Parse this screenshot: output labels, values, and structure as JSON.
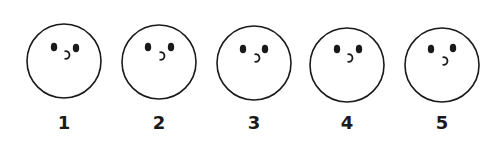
{
  "faces": [
    {
      "label": "1",
      "cx": 64,
      "cy": 61,
      "left_eye": [
        54,
        47
      ],
      "right_eye": [
        76,
        48
      ],
      "mouth": [
        67,
        55
      ]
    },
    {
      "label": "2",
      "cx": 159,
      "cy": 62,
      "left_eye": [
        148,
        47
      ],
      "right_eye": [
        171,
        47
      ],
      "mouth": [
        162,
        56
      ]
    },
    {
      "label": "3",
      "cx": 254,
      "cy": 63,
      "left_eye": [
        243,
        49
      ],
      "right_eye": [
        265,
        49
      ],
      "mouth": [
        257,
        58
      ]
    },
    {
      "label": "4",
      "cx": 347,
      "cy": 65,
      "left_eye": [
        337,
        49
      ],
      "right_eye": [
        359,
        49
      ],
      "mouth": [
        350,
        58
      ]
    },
    {
      "label": "5",
      "cx": 442,
      "cy": 65,
      "left_eye": [
        431,
        49
      ],
      "right_eye": [
        453,
        48
      ],
      "mouth": [
        445,
        61
      ]
    }
  ],
  "style": {
    "stroke_color": "#1a1a1a",
    "radius": 37
  }
}
